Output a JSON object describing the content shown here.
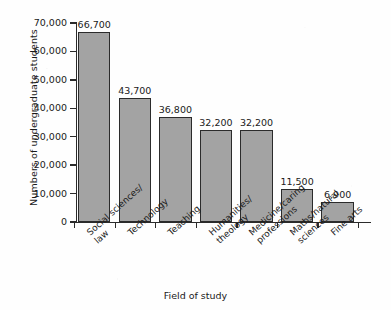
{
  "chart_data": {
    "type": "bar",
    "title": "",
    "xlabel": "Field of study",
    "ylabel": "Numbers of undergraduate students",
    "categories": [
      "Social sciences/\nlaw",
      "Technology",
      "Teaching",
      "Humanities/\ntheology",
      "Medicine/caring\nprofessions",
      "Maths/natural\nsciences",
      "Fine arts"
    ],
    "values": [
      66700,
      43700,
      36800,
      32200,
      32200,
      11500,
      6900
    ],
    "value_labels": [
      "66,700",
      "43,700",
      "36,800",
      "32,200",
      "32,200",
      "11,500",
      "6,900"
    ],
    "ylim": [
      0,
      70000
    ],
    "ytick_values": [
      0,
      10000,
      20000,
      30000,
      40000,
      50000,
      60000,
      70000
    ],
    "ytick_labels": [
      "0",
      "10,000",
      "20,000",
      "30,000",
      "40,000",
      "50,000",
      "60,000",
      "70,000"
    ],
    "grid": false,
    "legend": false,
    "bar_color": "#a3a3a3",
    "bar_edge_color": "#2b2b2b",
    "axis_color": "#2b2b2b",
    "background": "#ffffff"
  }
}
